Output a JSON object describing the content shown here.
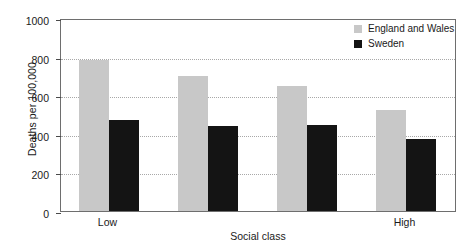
{
  "chart_data": {
    "type": "bar",
    "title": "",
    "xlabel": "Social class",
    "ylabel": "Deaths per 100,000",
    "categories": [
      "Low",
      "",
      "",
      "High"
    ],
    "xtick_labels": [
      "Low",
      "High"
    ],
    "ylim": [
      0,
      1000
    ],
    "ytick_labels": [
      "0",
      "200",
      "400",
      "600",
      "800",
      "1000"
    ],
    "yticks": [
      0,
      200,
      400,
      600,
      800,
      1000
    ],
    "grid": true,
    "legend_position": "top-right",
    "series": [
      {
        "name": "England and Wales",
        "color": "#c8c8c8",
        "values": [
          780,
          700,
          650,
          525
        ]
      },
      {
        "name": "Sweden",
        "color": "#141414",
        "values": [
          470,
          440,
          445,
          375
        ]
      }
    ]
  },
  "axes": {
    "y_title": "Deaths per 100,000",
    "x_title": "Social class",
    "y_ticks": [
      {
        "value": 1000,
        "label": "1000"
      },
      {
        "value": 800,
        "label": "800"
      },
      {
        "value": 600,
        "label": "600"
      },
      {
        "value": 400,
        "label": "400"
      },
      {
        "value": 200,
        "label": "200"
      },
      {
        "value": 0,
        "label": "0"
      }
    ],
    "x_ticks": [
      {
        "group": 0,
        "label": "Low"
      },
      {
        "group": 3,
        "label": "High"
      }
    ]
  },
  "legend": {
    "entries": [
      {
        "label": "England and Wales",
        "color": "#c8c8c8"
      },
      {
        "label": "Sweden",
        "color": "#141414"
      }
    ]
  },
  "style": {
    "series_1_color": "#c8c8c8",
    "series_2_color": "#141414",
    "frame_color": "#6e6e6e",
    "grid_color": "#a8a8a8",
    "background": "#ffffff"
  }
}
